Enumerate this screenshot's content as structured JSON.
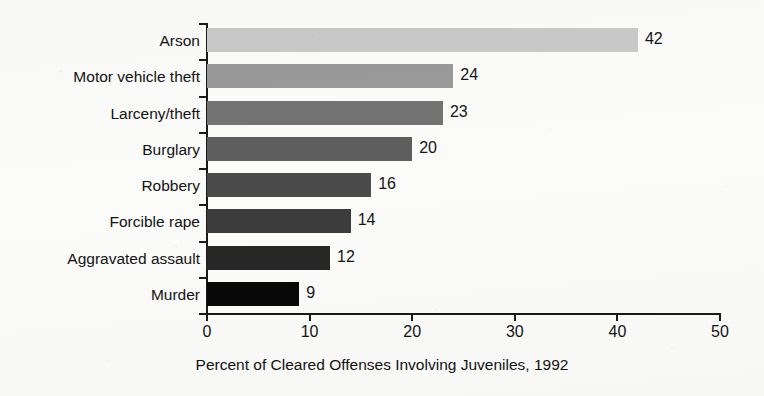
{
  "chart_data": {
    "type": "bar",
    "orientation": "horizontal",
    "title": "",
    "xlabel": "Percent of Cleared Offenses Involving Juveniles, 1992",
    "ylabel": "",
    "categories": [
      "Arson",
      "Motor vehicle theft",
      "Larceny/theft",
      "Burglary",
      "Robbery",
      "Forcible rape",
      "Aggravated assault",
      "Murder"
    ],
    "values": [
      42,
      24,
      23,
      20,
      16,
      14,
      12,
      9
    ],
    "value_labels": [
      "42",
      "24",
      "23",
      "20",
      "16",
      "14",
      "12",
      "9"
    ],
    "bar_colors": [
      "#c9c9c9",
      "#9a9a9a",
      "#737373",
      "#5e5e5e",
      "#4b4b4b",
      "#3c3c3c",
      "#272727",
      "#080808"
    ],
    "xlim": [
      0,
      50
    ],
    "xticks": [
      0,
      10,
      20,
      30,
      40,
      50
    ],
    "xtick_labels": [
      "0",
      "10",
      "20",
      "30",
      "40",
      "50"
    ],
    "grid": false,
    "legend": false,
    "axis_color": "#1a1a1a",
    "background_color": "#fbfbfa"
  }
}
